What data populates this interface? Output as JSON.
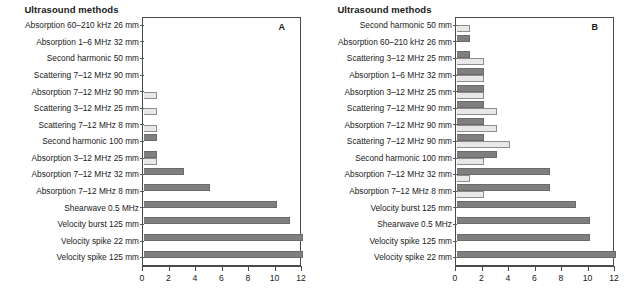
{
  "figure": {
    "panels": [
      {
        "id": "A",
        "letter": "A",
        "title": "Ultrasound methods",
        "axis": {
          "ticks": [
            0,
            2,
            4,
            6,
            8,
            10,
            12
          ],
          "tick_labels": [
            "0",
            "2",
            "4",
            "6",
            "8",
            "10",
            "12"
          ],
          "xlim": [
            0,
            12
          ]
        },
        "rows": [
          {
            "label": "Absorption 60–210 kHz 26 mm",
            "dark": 0,
            "light": 0
          },
          {
            "label": "Absorption 1–6 MHz 32 mm",
            "dark": 0,
            "light": 0
          },
          {
            "label": "Second harmonic 50 mm",
            "dark": 0,
            "light": 0
          },
          {
            "label": "Scattering 7–12 MHz 90 mm",
            "dark": 0,
            "light": 0
          },
          {
            "label": "Absorption 7–12 MHz 90 mm",
            "dark": 0,
            "light": 1
          },
          {
            "label": "Scattering 3–12 MHz 25 mm",
            "dark": 0,
            "light": 1
          },
          {
            "label": "Scattering 7–12 MHz 8 mm",
            "dark": 0,
            "light": 1
          },
          {
            "label": "Second harmonic 100 mm",
            "dark": 1,
            "light": 0
          },
          {
            "label": "Absorption 3–12 MHz 25 mm",
            "dark": 1,
            "light": 1
          },
          {
            "label": "Absorption 7–12 MHz 32 mm",
            "dark": 3,
            "light": 0
          },
          {
            "label": "Absorption 7–12 MHz 8 mm",
            "dark": 5,
            "light": 0
          },
          {
            "label": "Shearwave 0.5 MHz",
            "dark": 10,
            "light": 0
          },
          {
            "label": "Velocity burst 125 mm",
            "dark": 11,
            "light": 0
          },
          {
            "label": "Velocity spike 22 mm",
            "dark": 12,
            "light": 0
          },
          {
            "label": "Velocity spike 125 mm",
            "dark": 12,
            "light": 0
          }
        ]
      },
      {
        "id": "B",
        "letter": "B",
        "title": "Ultrasound methods",
        "axis": {
          "ticks": [
            0,
            2,
            4,
            6,
            8,
            10,
            12
          ],
          "tick_labels": [
            "0",
            "2",
            "4",
            "6",
            "8",
            "10",
            "12"
          ],
          "xlim": [
            0,
            12
          ]
        },
        "rows": [
          {
            "label": "Second harmonic 50 mm",
            "dark": 0,
            "light": 1
          },
          {
            "label": "Absorption 60–210 kHz 26 mm",
            "dark": 1,
            "light": 0
          },
          {
            "label": "Scattering 3–12 MHz 25 mm",
            "dark": 1,
            "light": 2
          },
          {
            "label": "Absorption 1–6 MHz 32 mm",
            "dark": 2,
            "light": 2
          },
          {
            "label": "Absorption 3–12 MHz 25 mm",
            "dark": 2,
            "light": 2
          },
          {
            "label": "Scattering 7–12 MHz 90 mm",
            "dark": 2,
            "light": 3
          },
          {
            "label": "Absorption 7–12 MHz 90 mm",
            "dark": 2,
            "light": 3
          },
          {
            "label": "Scattering 7–12 MHz 90 mm",
            "dark": 2,
            "light": 4
          },
          {
            "label": "Second harmonic 100 mm",
            "dark": 3,
            "light": 2
          },
          {
            "label": "Absorption 7–12 MHz 32 mm",
            "dark": 7,
            "light": 1
          },
          {
            "label": "Absorption 7–12 MHz 8 mm",
            "dark": 7,
            "light": 2
          },
          {
            "label": "Velocity burst 125 mm",
            "dark": 9,
            "light": 0
          },
          {
            "label": "Shearwave 0.5 MHz",
            "dark": 10,
            "light": 0
          },
          {
            "label": "Velocity spike 125 mm",
            "dark": 10,
            "light": 0
          },
          {
            "label": "Velocity spike 22 mm",
            "dark": 12,
            "light": 0
          }
        ]
      }
    ]
  },
  "chart_data": {
    "type": "bar",
    "title": "Ultrasound methods",
    "orientation": "horizontal",
    "xlabel": "",
    "ylabel": "Ultrasound methods",
    "xlim": [
      0,
      12
    ],
    "grid": false,
    "legend": "none",
    "colors": {
      "dark_series": "#7f7f7f",
      "light_series": "#e8e8e8",
      "axis": "#4a4a4a"
    },
    "panels": [
      {
        "panel": "A",
        "categories": [
          "Absorption 60–210 kHz 26 mm",
          "Absorption 1–6 MHz 32 mm",
          "Second harmonic 50 mm",
          "Scattering 7–12 MHz 90 mm",
          "Absorption 7–12 MHz 90 mm",
          "Scattering 3–12 MHz 25 mm",
          "Scattering 7–12 MHz 8 mm",
          "Second harmonic 100 mm",
          "Absorption 3–12 MHz 25 mm",
          "Absorption 7–12 MHz 32 mm",
          "Absorption 7–12 MHz 8 mm",
          "Shearwave 0.5 MHz",
          "Velocity burst 125 mm",
          "Velocity spike 22 mm",
          "Velocity spike 125 mm"
        ],
        "series": [
          {
            "name": "dark",
            "values": [
              0,
              0,
              0,
              0,
              0,
              0,
              0,
              1,
              1,
              3,
              5,
              10,
              11,
              12,
              12
            ]
          },
          {
            "name": "light",
            "values": [
              0,
              0,
              0,
              0,
              1,
              1,
              1,
              0,
              1,
              0,
              0,
              0,
              0,
              0,
              0
            ]
          }
        ],
        "xticks": [
          0,
          2,
          4,
          6,
          8,
          10,
          12
        ]
      },
      {
        "panel": "B",
        "categories": [
          "Second harmonic 50 mm",
          "Absorption 60–210 kHz 26 mm",
          "Scattering 3–12 MHz 25 mm",
          "Absorption 1–6 MHz 32 mm",
          "Absorption 3–12 MHz 25 mm",
          "Scattering 7–12 MHz 90 mm",
          "Absorption 7–12 MHz 90 mm",
          "Scattering 7–12 MHz 90 mm",
          "Second harmonic 100 mm",
          "Absorption 7–12 MHz 32 mm",
          "Absorption 7–12 MHz 8 mm",
          "Velocity burst 125 mm",
          "Shearwave 0.5 MHz",
          "Velocity spike 125 mm",
          "Velocity spike 22 mm"
        ],
        "series": [
          {
            "name": "dark",
            "values": [
              0,
              1,
              1,
              2,
              2,
              2,
              2,
              2,
              3,
              7,
              7,
              9,
              10,
              10,
              12
            ]
          },
          {
            "name": "light",
            "values": [
              1,
              0,
              2,
              2,
              2,
              3,
              3,
              4,
              2,
              1,
              2,
              0,
              0,
              0,
              0
            ]
          }
        ],
        "xticks": [
          0,
          2,
          4,
          6,
          8,
          10,
          12
        ]
      }
    ]
  }
}
